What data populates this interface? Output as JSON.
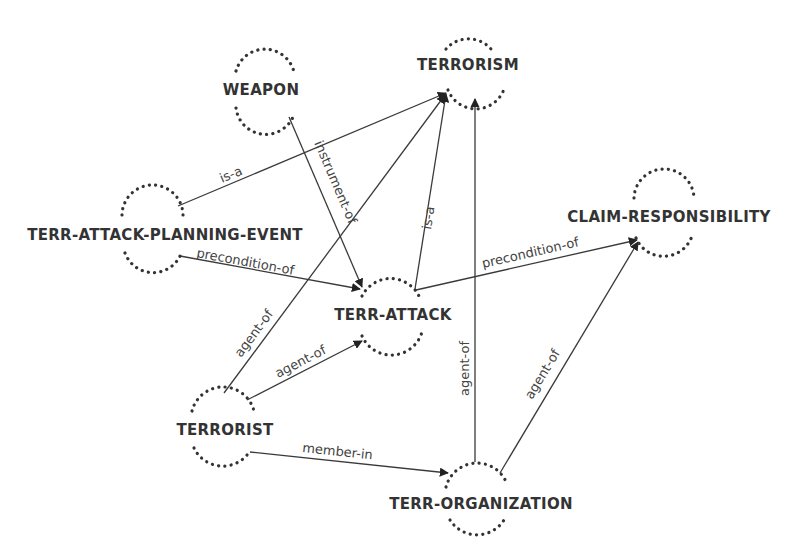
{
  "diagram": {
    "type": "concept-graph",
    "nodes": [
      {
        "id": "terrorism",
        "label": "TERRORISM",
        "x": 468,
        "y": 65
      },
      {
        "id": "weapon",
        "label": "WEAPON",
        "x": 258,
        "y": 89
      },
      {
        "id": "terr_attack_planning_event",
        "label": "TERR-ATTACK-PLANNING-EVENT",
        "x": 160,
        "y": 234
      },
      {
        "id": "claim_responsibility",
        "label": "CLAIM-RESPONSIBILITY",
        "x": 666,
        "y": 215
      },
      {
        "id": "terr_attack",
        "label": "TERR-ATTACK",
        "x": 393,
        "y": 313
      },
      {
        "id": "terrorist",
        "label": "TERRORIST",
        "x": 222,
        "y": 427
      },
      {
        "id": "terr_organization",
        "label": "TERR-ORGANIZATION",
        "x": 477,
        "y": 501
      }
    ],
    "edges": [
      {
        "from": "terr_attack_planning_event",
        "to": "terrorism",
        "label": "is-a"
      },
      {
        "from": "weapon",
        "to": "terr_attack",
        "label": "instrument-of"
      },
      {
        "from": "terr_attack_planning_event",
        "to": "terr_attack",
        "label": "precondition-of"
      },
      {
        "from": "terr_attack",
        "to": "terrorism",
        "label": "is-a"
      },
      {
        "from": "terr_attack",
        "to": "claim_responsibility",
        "label": "precondition-of"
      },
      {
        "from": "terrorist",
        "to": "terrorism",
        "label": "agent-of"
      },
      {
        "from": "terrorist",
        "to": "terr_attack",
        "label": "agent-of"
      },
      {
        "from": "terrorist",
        "to": "terr_organization",
        "label": "member-in"
      },
      {
        "from": "terr_organization",
        "to": "terrorism",
        "label": "agent-of"
      },
      {
        "from": "terr_organization",
        "to": "claim_responsibility",
        "label": "agent-of"
      }
    ]
  }
}
